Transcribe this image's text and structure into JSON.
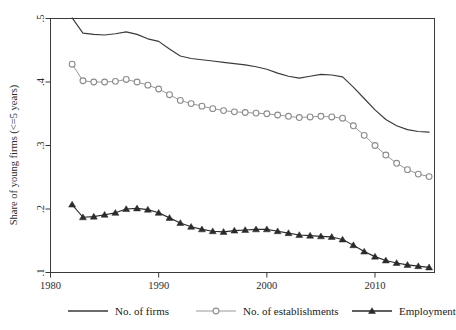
{
  "chart_data": {
    "type": "line",
    "title": "",
    "xlabel": "",
    "ylabel": "Share of young firms (<=5 years)",
    "xlim": [
      1980,
      2015.5
    ],
    "ylim": [
      0.1,
      0.5
    ],
    "grid": false,
    "legend_position": "bottom",
    "xticks": [
      "1980",
      "1990",
      "2000",
      "2010"
    ],
    "xtick_values": [
      1980,
      1990,
      2000,
      2010
    ],
    "yticks": [
      ".5",
      ".4",
      ".3",
      ".2",
      ".1"
    ],
    "ytick_values": [
      0.5,
      0.4,
      0.3,
      0.2,
      0.1
    ],
    "x": [
      1982,
      1983,
      1984,
      1985,
      1986,
      1987,
      1988,
      1989,
      1990,
      1991,
      1992,
      1993,
      1994,
      1995,
      1996,
      1997,
      1998,
      1999,
      2000,
      2001,
      2002,
      2003,
      2004,
      2005,
      2006,
      2007,
      2008,
      2009,
      2010,
      2011,
      2012,
      2013,
      2014,
      2015
    ],
    "series": [
      {
        "name": "No. of firms",
        "marker": "none",
        "color": "#3a3a3a",
        "values": [
          0.501,
          0.477,
          0.475,
          0.474,
          0.476,
          0.479,
          0.475,
          0.468,
          0.464,
          0.452,
          0.441,
          0.437,
          0.435,
          0.433,
          0.431,
          0.429,
          0.427,
          0.424,
          0.42,
          0.414,
          0.409,
          0.406,
          0.409,
          0.412,
          0.411,
          0.408,
          0.392,
          0.374,
          0.356,
          0.341,
          0.331,
          0.325,
          0.322,
          0.321
        ]
      },
      {
        "name": "No. of establishments",
        "marker": "circle",
        "color": "#8c8c8c",
        "values": [
          0.428,
          0.402,
          0.4,
          0.4,
          0.401,
          0.404,
          0.4,
          0.395,
          0.389,
          0.38,
          0.371,
          0.366,
          0.362,
          0.358,
          0.355,
          0.353,
          0.352,
          0.351,
          0.35,
          0.348,
          0.346,
          0.344,
          0.345,
          0.346,
          0.345,
          0.343,
          0.331,
          0.316,
          0.3,
          0.285,
          0.272,
          0.262,
          0.255,
          0.251
        ]
      },
      {
        "name": "Employment",
        "marker": "triangle",
        "color": "#2b2b2b",
        "values": [
          0.207,
          0.187,
          0.188,
          0.191,
          0.194,
          0.2,
          0.201,
          0.199,
          0.194,
          0.186,
          0.178,
          0.172,
          0.168,
          0.165,
          0.164,
          0.166,
          0.167,
          0.168,
          0.168,
          0.165,
          0.162,
          0.159,
          0.158,
          0.157,
          0.156,
          0.152,
          0.143,
          0.133,
          0.125,
          0.119,
          0.115,
          0.112,
          0.11,
          0.108
        ]
      }
    ]
  },
  "legend": {
    "items": [
      {
        "label": "No. of firms",
        "marker": "none"
      },
      {
        "label": "No. of establishments",
        "marker": "circle"
      },
      {
        "label": "Employment",
        "marker": "triangle"
      }
    ]
  }
}
